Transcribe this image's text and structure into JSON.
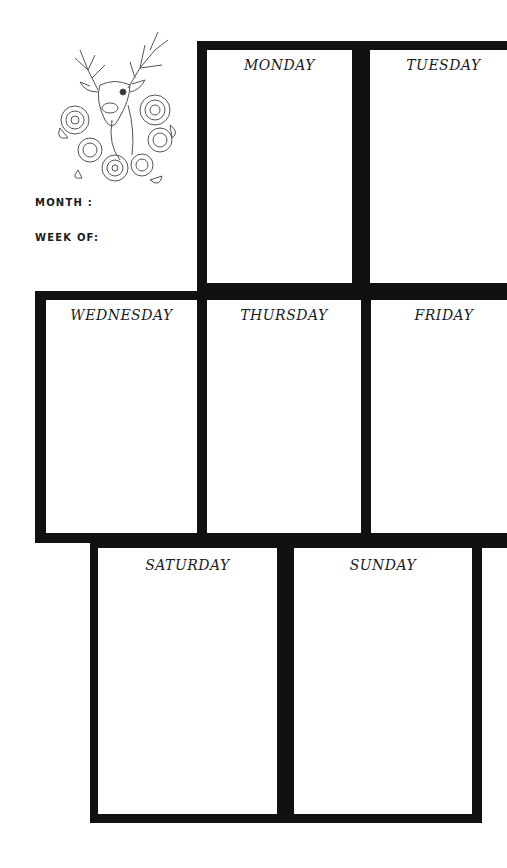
{
  "header": {
    "illustration": "deer-with-roses-mandala",
    "month_label": "MONTH :",
    "week_label": "WEEK OF:"
  },
  "days": [
    {
      "label": "MONDAY"
    },
    {
      "label": "TUESDAY"
    },
    {
      "label": "WEDNESDAY"
    },
    {
      "label": "THURSDAY"
    },
    {
      "label": "FRIDAY"
    },
    {
      "label": "SATURDAY"
    },
    {
      "label": "SUNDAY"
    }
  ],
  "colors": {
    "border": "#111111",
    "background": "#ffffff",
    "text": "#1a1a1a"
  }
}
